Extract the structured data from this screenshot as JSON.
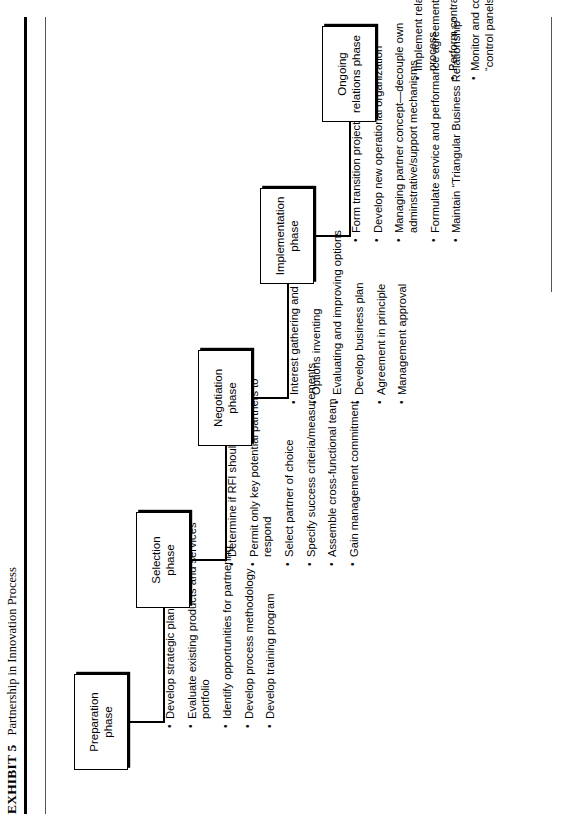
{
  "exhibit": {
    "tag": "EXHIBIT 5",
    "caption": "Partnership in Innovation Process"
  },
  "phases": [
    {
      "id": "preparation",
      "title": "Preparation\nphase",
      "title_line1": "Preparation",
      "title_line2": "phase",
      "bullets": [
        "Develop strategic plan",
        "Evaluate existing products and services portfolio",
        "Identify opportunities for partnering",
        "Develop process methodology",
        "Develop training program"
      ]
    },
    {
      "id": "selection",
      "title_line1": "Selection",
      "title_line2": "phase",
      "bullets": [
        "Determine if RFI should be issued",
        "Permit only key potential partners to respond",
        "Select partner of choice",
        "Specify success criteria/measurements",
        "Assemble cross-functional team",
        "Gain management commitment"
      ]
    },
    {
      "id": "negotiation",
      "title_line1": "Negotiation",
      "title_line2": "phase",
      "bullets": [
        "Interest gathering and sharing",
        "Options inventing",
        "Evaluating and improving options",
        "Develop business plan",
        "Agreement in principle",
        "Management approval"
      ]
    },
    {
      "id": "implementation",
      "title_line1": "Implementation",
      "title_line2": "phase",
      "bullets": [
        "Form transition project team",
        "Develop new operational organization",
        "Managing partner concept—decouple own adminstrative/support mechanisms",
        "Formulate service and performance agreements",
        "Maintain “Triangular Business Relationship”"
      ]
    },
    {
      "id": "ongoing",
      "title_line1": "Ongoing",
      "title_line2": "relations phase",
      "bullets": [
        "Implement relationship management process",
        "Perform contract maintenance",
        "Monitor and continuously enhance “control panels”"
      ]
    }
  ],
  "colors": {
    "ink": "#000000",
    "rule": "#555555",
    "paper": "#ffffff"
  }
}
